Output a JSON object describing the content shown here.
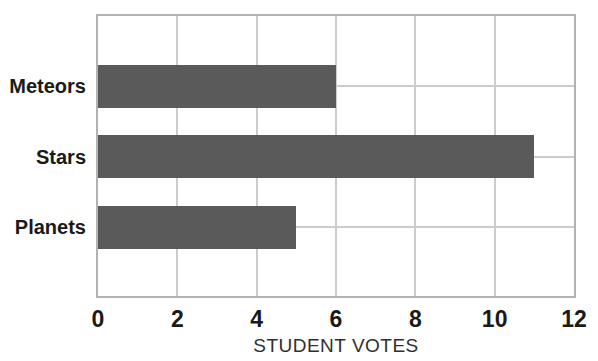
{
  "chart_data": {
    "type": "bar",
    "orientation": "horizontal",
    "title": "",
    "categories": [
      "Meteors",
      "Stars",
      "Planets"
    ],
    "values": [
      6,
      11,
      5
    ],
    "xlabel": "STUDENT VOTES",
    "ylabel": "",
    "xlim": [
      0,
      12
    ],
    "xtick_labels": [
      "0",
      "2",
      "4",
      "6",
      "8",
      "10",
      "12"
    ],
    "xtick_values": [
      0,
      2,
      4,
      6,
      8,
      10,
      12
    ],
    "grid": true,
    "legend": false,
    "bar_color": "#5a5a5a",
    "grid_color": "#cccccc",
    "plot_border_color": "#b2b2b2",
    "tick_label_color": "#1a1a1a",
    "category_label_color": "#1a1a1a",
    "axis_title_color": "#2f2f2f",
    "background_color": "#ffffff"
  }
}
